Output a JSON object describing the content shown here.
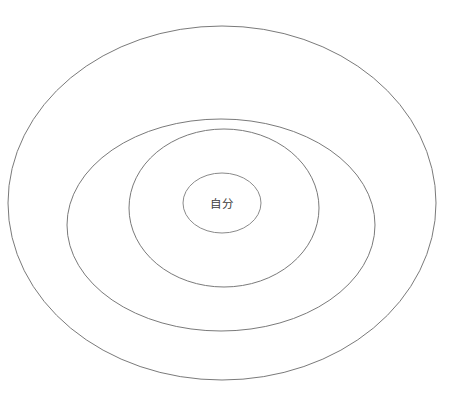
{
  "diagram": {
    "type": "concentric-ellipses",
    "title": "",
    "background_color": "#ffffff",
    "canvas": {
      "width": 462,
      "height": 400
    },
    "center_label": {
      "text": "自分",
      "color": "#3c3c3c",
      "font_size": 11.5,
      "x": 222,
      "y": 204
    },
    "rings": [
      {
        "name": "ring-outermost",
        "index": 1,
        "cx": 222,
        "cy": 203,
        "rx": 214,
        "ry": 177,
        "stroke": "#7a7a7a",
        "stroke_width": 1,
        "fill": "none",
        "label": ""
      },
      {
        "name": "ring-second",
        "index": 2,
        "cx": 221,
        "cy": 225,
        "rx": 154,
        "ry": 106,
        "stroke": "#7a7a7a",
        "stroke_width": 1,
        "fill": "none",
        "label": ""
      },
      {
        "name": "ring-third",
        "index": 3,
        "cx": 224,
        "cy": 208,
        "rx": 95,
        "ry": 79,
        "stroke": "#7a7a7a",
        "stroke_width": 1,
        "fill": "none",
        "label": ""
      },
      {
        "name": "ring-innermost",
        "index": 4,
        "cx": 222,
        "cy": 203,
        "rx": 39,
        "ry": 30,
        "stroke": "#8a8a8a",
        "stroke_width": 1,
        "fill": "none",
        "label": "自分"
      }
    ]
  }
}
